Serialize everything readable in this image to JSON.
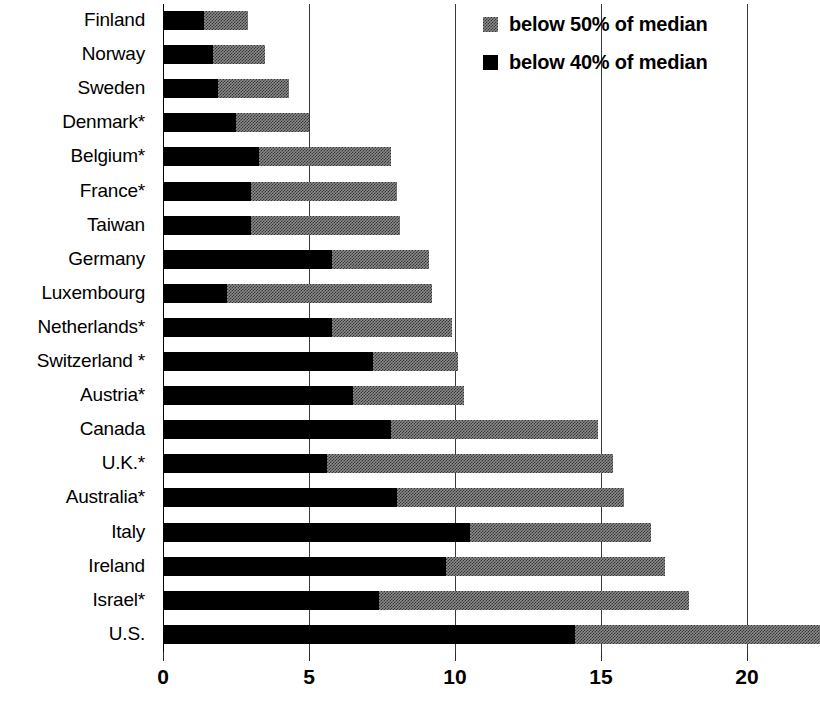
{
  "chart_data": {
    "type": "bar",
    "orientation": "horizontal",
    "stacked": true,
    "title": "",
    "xlabel": "",
    "ylabel": "",
    "xlim": [
      0,
      22.5
    ],
    "grid": true,
    "gridlines": [
      0,
      5,
      10,
      15,
      20
    ],
    "xticks": [
      0,
      5,
      10,
      15,
      20
    ],
    "xticklabels": [
      "0",
      "5",
      "10",
      "15",
      "20"
    ],
    "legend_position": "top-right",
    "legend": [
      {
        "label": "below 50% of median",
        "swatch": "gray"
      },
      {
        "label": "below 40% of median",
        "swatch": "black"
      }
    ],
    "categories": [
      "Finland",
      "Norway",
      "Sweden",
      "Denmark*",
      "Belgium*",
      "France*",
      "Taiwan",
      "Germany",
      "Luxembourg",
      "Netherlands*",
      "Switzerland *",
      "Austria*",
      "Canada",
      "U.K.*",
      "Australia*",
      "Italy",
      "Ireland",
      "Israel*",
      "U.S."
    ],
    "series": [
      {
        "name": "below 40% of median",
        "color": "#000000",
        "values": [
          1.4,
          1.7,
          1.9,
          2.5,
          3.3,
          3.0,
          3.0,
          5.8,
          2.2,
          5.8,
          7.2,
          6.5,
          7.8,
          5.6,
          8.0,
          10.5,
          9.7,
          7.4,
          14.1
        ]
      },
      {
        "name": "below 50% of median",
        "color": "#8a8a8a",
        "values": [
          2.9,
          3.5,
          4.3,
          5.0,
          7.8,
          8.0,
          8.1,
          9.1,
          9.2,
          9.9,
          10.1,
          10.3,
          14.9,
          15.4,
          15.8,
          16.7,
          17.2,
          18.0,
          22.5
        ]
      }
    ]
  }
}
